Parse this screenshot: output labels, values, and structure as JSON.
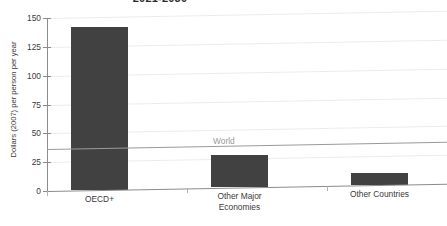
{
  "chart_data": {
    "type": "bar",
    "title": "2021-2030",
    "xlabel": "",
    "ylabel": "Dollars (2007) per person per year",
    "categories": [
      "OECD+",
      "Other Major\nEconomies",
      "Other Countries"
    ],
    "category_labels": [
      [
        "OECD+"
      ],
      [
        "Other Major",
        "Economies"
      ],
      [
        "Other Countries"
      ]
    ],
    "values": [
      141,
      28,
      10
    ],
    "ylim": [
      0,
      150
    ],
    "yticks": [
      0,
      25,
      50,
      75,
      100,
      125,
      150
    ],
    "ytick_labels": [
      "0",
      "25",
      "50",
      "75",
      "100",
      "125",
      "150"
    ],
    "grid": true,
    "grid_axis": "y",
    "legend": "none",
    "annotations": [
      {
        "label": "World",
        "type": "horizontal-reference-line",
        "value": 36,
        "color": "#9a9a9a"
      }
    ],
    "series": [
      {
        "name": "Average annual cost",
        "color": "#414141",
        "values": [
          141,
          28,
          10
        ]
      }
    ],
    "bar_color": "#414141",
    "grid_color": "#ececec",
    "axis_color": "#8c8c8c"
  }
}
